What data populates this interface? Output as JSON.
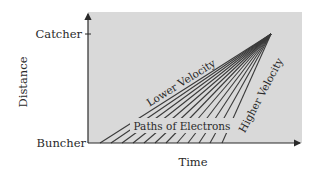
{
  "diagram": {
    "type": "velocity-modulation time-distance (Applegate) diagram",
    "colors": {
      "background": "#ffffff",
      "plot_fill": "#d9d9d9",
      "axis": "#2a2a2a",
      "paths": "#3a3a3a",
      "text": "#2a2a2a"
    },
    "axes": {
      "y_label": "Distance",
      "x_label": "Time",
      "y_ticks": [
        {
          "label": "Catcher",
          "position": "top"
        },
        {
          "label": "Buncher",
          "position": "bottom"
        }
      ]
    },
    "annotations": {
      "lower_velocity": "Lower Velocity",
      "higher_velocity": "Higher Velocity",
      "paths": "Paths of Electrons"
    },
    "electron_paths": {
      "count": 12,
      "convergence_point": "Catcher",
      "start_x": [
        100,
        111,
        122,
        133,
        144,
        155,
        166,
        177,
        188,
        199,
        210,
        222
      ],
      "note": "lines start at Buncher at successive times and converge at the Catcher"
    }
  }
}
